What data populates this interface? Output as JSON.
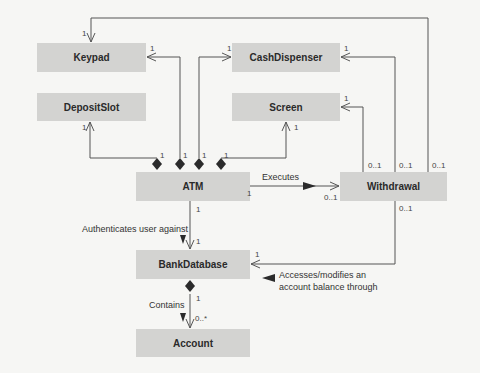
{
  "diagram": {
    "type": "UML class diagram",
    "classes": [
      {
        "id": "keypad",
        "name": "Keypad"
      },
      {
        "id": "cashdispenser",
        "name": "CashDispenser"
      },
      {
        "id": "depositslot",
        "name": "DepositSlot"
      },
      {
        "id": "screen",
        "name": "Screen"
      },
      {
        "id": "atm",
        "name": "ATM"
      },
      {
        "id": "withdrawal",
        "name": "Withdrawal"
      },
      {
        "id": "bankdatabase",
        "name": "BankDatabase"
      },
      {
        "id": "account",
        "name": "Account"
      }
    ],
    "associations": {
      "executes": {
        "label": "Executes",
        "from": "ATM",
        "to": "Withdrawal",
        "from_mult": "1",
        "to_mult": "0..1"
      },
      "authenticates": {
        "label": "Authenticates user against",
        "from": "ATM",
        "to": "BankDatabase",
        "from_mult": "1",
        "to_mult": "1"
      },
      "contains": {
        "label": "Contains",
        "from": "BankDatabase",
        "to": "Account",
        "from_mult": "1",
        "to_mult": "0..*"
      },
      "accesses": {
        "label_line1": "Accesses/modifies an",
        "label_line2": "account balance through",
        "from": "Withdrawal",
        "to": "BankDatabase",
        "from_mult": "0..1",
        "to_mult": "1"
      }
    },
    "compositions": [
      {
        "whole": "ATM",
        "part": "Keypad",
        "whole_mult": "1",
        "part_mult": "1"
      },
      {
        "whole": "ATM",
        "part": "CashDispenser",
        "whole_mult": "1",
        "part_mult": "1"
      },
      {
        "whole": "ATM",
        "part": "DepositSlot",
        "whole_mult": "1",
        "part_mult": "1"
      },
      {
        "whole": "ATM",
        "part": "Screen",
        "whole_mult": "1",
        "part_mult": "1"
      }
    ],
    "withdrawal_links": [
      {
        "to": "Keypad",
        "from_mult": "0..1",
        "to_mult": "1"
      },
      {
        "to": "CashDispenser",
        "from_mult": "0..1",
        "to_mult": "1"
      },
      {
        "to": "Screen",
        "from_mult": "0..1",
        "to_mult": "1"
      }
    ],
    "multiplicities": {
      "one": "1",
      "zero_one": "0..1",
      "zero_many": "0..*"
    },
    "colors": {
      "class_fill": "#d3d3d1",
      "line": "#555555",
      "background": "#f6f6f4"
    }
  }
}
